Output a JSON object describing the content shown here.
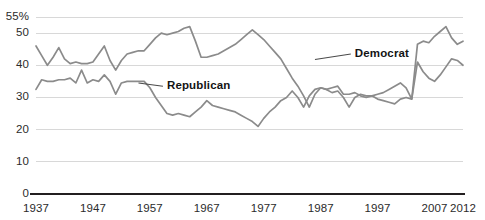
{
  "chart_data": {
    "type": "line",
    "title": "",
    "subtitle": "",
    "xlabel": "",
    "ylabel": "",
    "grid": true,
    "legend_position": "inline-annotation",
    "xlim": [
      1937,
      2012
    ],
    "ylim": [
      0,
      55
    ],
    "y_ticks": [
      0,
      10,
      20,
      30,
      40,
      50,
      55
    ],
    "y_tick_labels": [
      "0",
      "10",
      "20",
      "30",
      "40",
      "50",
      "55%"
    ],
    "x_ticks": [
      1937,
      1947,
      1957,
      1967,
      1977,
      1987,
      1997,
      2007,
      2012
    ],
    "x_tick_labels": [
      "1937",
      "1947",
      "1957",
      "1967",
      "1977",
      "1987",
      "1997",
      "2007",
      "2012"
    ],
    "colors": {
      "democrat_line": "#8b8b8b",
      "republican_line": "#8b8b8b",
      "gridline": "#d8d8d8",
      "axis": "#231f20",
      "text": "#231f20",
      "background": "#ffffff"
    },
    "annotations": [
      {
        "name": "democrat-label",
        "text": "Democrat",
        "x": 1993,
        "y": 43.5,
        "leader_to_x": 1986,
        "leader_to_y": 41.8
      },
      {
        "name": "republican-label",
        "text": "Republican",
        "x": 1960,
        "y": 33.5,
        "leader_to_x": 1955,
        "leader_to_y": 34.5
      }
    ],
    "series": [
      {
        "name": "Democrat",
        "label": "Democrat",
        "color": "#8b8b8b",
        "x": [
          1937,
          1938,
          1939,
          1940,
          1941,
          1942,
          1943,
          1944,
          1945,
          1946,
          1947,
          1948,
          1949,
          1950,
          1951,
          1952,
          1953,
          1954,
          1955,
          1956,
          1957,
          1958,
          1959,
          1960,
          1961,
          1962,
          1963,
          1964,
          1965,
          1966,
          1967,
          1968,
          1969,
          1970,
          1971,
          1972,
          1973,
          1974,
          1975,
          1976,
          1977,
          1978,
          1979,
          1980,
          1981,
          1982,
          1983,
          1984,
          1985,
          1986,
          1987,
          1988,
          1989,
          1990,
          1991,
          1992,
          1993,
          1994,
          1995,
          1996,
          1997,
          1998,
          1999,
          2000,
          2001,
          2002,
          2003,
          2004,
          2005,
          2006,
          2007,
          2008,
          2009,
          2010,
          2011,
          2012
        ],
        "values": [
          46.0,
          43.0,
          40.0,
          42.5,
          45.5,
          42.0,
          40.5,
          41.0,
          40.5,
          40.5,
          41.0,
          43.5,
          46.0,
          41.5,
          38.5,
          41.5,
          43.5,
          44.0,
          44.5,
          44.5,
          46.5,
          48.5,
          50.0,
          49.5,
          50.0,
          50.5,
          51.5,
          52.0,
          47.5,
          42.5,
          42.5,
          43.0,
          43.5,
          44.5,
          45.5,
          46.5,
          48.0,
          49.5,
          51.0,
          49.5,
          48.0,
          46.0,
          44.0,
          42.0,
          39.0,
          36.0,
          33.5,
          30.5,
          27.0,
          31.0,
          33.0,
          32.5,
          31.5,
          32.0,
          30.0,
          27.0,
          30.0,
          31.0,
          30.5,
          30.5,
          29.5,
          29.0,
          28.5,
          28.0,
          29.5,
          30.0,
          29.5,
          46.5,
          47.5,
          47.0,
          49.0,
          50.5,
          52.0,
          48.5,
          46.5,
          47.5
        ]
      },
      {
        "name": "Republican",
        "label": "Republican",
        "color": "#8b8b8b",
        "x": [
          1937,
          1938,
          1939,
          1940,
          1941,
          1942,
          1943,
          1944,
          1945,
          1946,
          1947,
          1948,
          1949,
          1950,
          1951,
          1952,
          1953,
          1954,
          1955,
          1956,
          1957,
          1958,
          1959,
          1960,
          1961,
          1962,
          1963,
          1964,
          1965,
          1966,
          1967,
          1968,
          1969,
          1970,
          1971,
          1972,
          1973,
          1974,
          1975,
          1976,
          1977,
          1978,
          1979,
          1980,
          1981,
          1982,
          1983,
          1984,
          1985,
          1986,
          1987,
          1988,
          1989,
          1990,
          1991,
          1992,
          1993,
          1994,
          1995,
          1996,
          1997,
          1998,
          1999,
          2000,
          2001,
          2002,
          2003,
          2004,
          2005,
          2006,
          2007,
          2008,
          2009,
          2010,
          2011,
          2012
        ],
        "values": [
          32.5,
          35.5,
          35.0,
          35.0,
          35.5,
          35.5,
          36.0,
          34.5,
          38.5,
          34.5,
          35.5,
          35.0,
          37.0,
          35.0,
          31.0,
          34.5,
          35.0,
          35.0,
          35.0,
          35.0,
          33.0,
          30.0,
          27.5,
          25.0,
          24.5,
          25.0,
          24.5,
          24.0,
          25.5,
          27.0,
          29.0,
          27.5,
          27.0,
          26.5,
          26.0,
          25.5,
          24.5,
          23.5,
          22.5,
          21.0,
          23.5,
          25.5,
          27.0,
          29.0,
          30.0,
          32.0,
          30.0,
          27.0,
          30.5,
          32.5,
          33.0,
          32.5,
          33.0,
          33.5,
          31.0,
          31.0,
          31.5,
          30.5,
          30.0,
          30.5,
          31.0,
          31.5,
          32.5,
          33.5,
          34.5,
          33.0,
          29.5,
          41.0,
          38.0,
          36.0,
          35.0,
          37.0,
          39.5,
          42.0,
          41.5,
          40.0
        ]
      }
    ]
  }
}
